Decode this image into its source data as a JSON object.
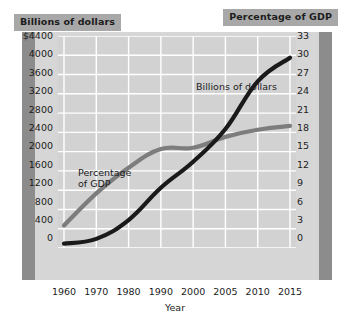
{
  "banners": {
    "left": "Billions of dollars",
    "right": "Percentage of GDP"
  },
  "colors": {
    "series_billions": "#1a1a1a",
    "series_percent": "#7d7d7d",
    "banner_background": "#a8a8a8",
    "plot_background": "#d2d2d2",
    "plate_background": "#d6d6d6",
    "axis_bar": "#8c8c8c",
    "gridline": "#ffffff"
  },
  "labels": {
    "series_percent": "Percentage\nof GDP",
    "series_billions": "Billions of dollars"
  },
  "chart_data": {
    "type": "line",
    "title": "",
    "xlabel": "Year",
    "grid": true,
    "legend_position": "inline-annotations",
    "categories": [
      "1960",
      "1970",
      "1980",
      "1990",
      "2000",
      "2005",
      "2010",
      "2015"
    ],
    "x_tick_labels": [
      "1960",
      "1970",
      "1980",
      "1990",
      "2000",
      "2005",
      "2010",
      "2015"
    ],
    "axes": [
      {
        "id": "left",
        "label": "Billions of dollars",
        "ylim": [
          0,
          4400
        ],
        "tick_step": 400,
        "tick_labels": [
          "$4400",
          "4000",
          "3600",
          "3200",
          "2800",
          "2400",
          "2000",
          "1600",
          "1200",
          "800",
          "400",
          "0"
        ],
        "tick_values": [
          4400,
          4000,
          3600,
          3200,
          2800,
          2400,
          2000,
          1600,
          1200,
          800,
          400,
          0
        ]
      },
      {
        "id": "right",
        "label": "Percentage of GDP",
        "ylim": [
          0,
          33
        ],
        "tick_step": 3,
        "tick_labels": [
          "33",
          "30",
          "27",
          "24",
          "21",
          "18",
          "15",
          "12",
          "9",
          "6",
          "3",
          "0"
        ],
        "tick_values": [
          33,
          30,
          27,
          24,
          21,
          18,
          15,
          12,
          9,
          6,
          3,
          0
        ]
      }
    ],
    "series": [
      {
        "name": "Billions of dollars",
        "axis": "left",
        "color": "#1a1a1a",
        "unit": "billions of dollars",
        "x": [
          "1960",
          "1970",
          "1980",
          "1990",
          "2000",
          "2005",
          "2010",
          "2015"
        ],
        "values": [
          90,
          190,
          580,
          1250,
          1790,
          2470,
          3460,
          3950
        ]
      },
      {
        "name": "Percentage of GDP",
        "axis": "right",
        "color": "#7d7d7d",
        "unit": "percent of GDP",
        "x": [
          "1960",
          "1970",
          "1980",
          "1990",
          "2000",
          "2005",
          "2010",
          "2015"
        ],
        "values": [
          3.5,
          8.5,
          12.5,
          15.4,
          15.6,
          17.3,
          18.4,
          19.0
        ]
      }
    ]
  }
}
